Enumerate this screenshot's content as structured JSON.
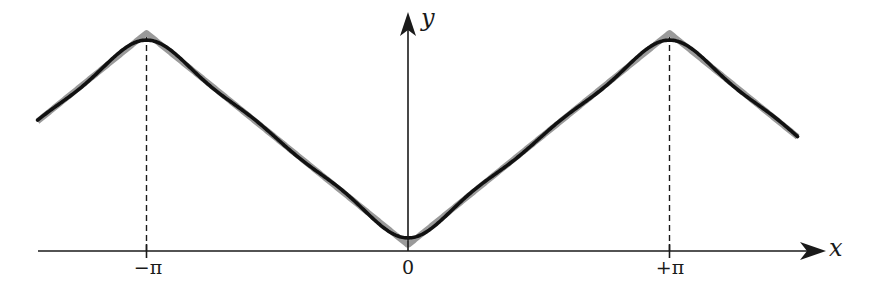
{
  "chart_data": {
    "type": "line",
    "title": "",
    "xlabel": "x",
    "ylabel": "y",
    "x_ticks": [
      {
        "value": -3.14159,
        "label": "−π"
      },
      {
        "value": 0,
        "label": "0"
      },
      {
        "value": 3.14159,
        "label": "+π"
      }
    ],
    "xlim": [
      -4.45,
      4.68
    ],
    "ylim": [
      0,
      3.14159
    ],
    "grid": false,
    "legend": null,
    "guides": [
      {
        "type": "vertical-dashed",
        "x": -3.14159,
        "from_y": 0,
        "to_y": 3.14159
      },
      {
        "type": "vertical-dashed",
        "x": 3.14159,
        "from_y": 0,
        "to_y": 3.14159
      }
    ],
    "series": [
      {
        "name": "target |x| (periodic triangle wave)",
        "style": "thick gray",
        "color": "#9a9a9a",
        "function": "periodic |x| with period 2π",
        "x": [
          -4.45,
          -3.14159,
          0,
          3.14159,
          4.68
        ],
        "y": [
          1.83,
          3.14159,
          0,
          3.14159,
          1.6
        ]
      },
      {
        "name": "Fourier partial sum",
        "style": "black wavy",
        "color": "#111111",
        "function": "π/2 − (4/π)(cos x + cos 3x/9 + cos 5x/25)",
        "terms": [
          1,
          3,
          5
        ],
        "sample_points": [
          {
            "x": -3.14159,
            "y": 3.08
          },
          {
            "x": -1.5708,
            "y": 1.5708
          },
          {
            "x": 0,
            "y": 0.06
          },
          {
            "x": 1.5708,
            "y": 1.5708
          },
          {
            "x": 3.14159,
            "y": 3.08
          }
        ]
      }
    ]
  },
  "axes": {
    "x_label": "x",
    "y_label": "y",
    "tick_labels": [
      "−π",
      "0",
      "+π"
    ]
  },
  "colors": {
    "axis": "#1a1a1a",
    "target_curve": "#9a9a9a",
    "approx_curve": "#111111",
    "background": "#ffffff"
  }
}
